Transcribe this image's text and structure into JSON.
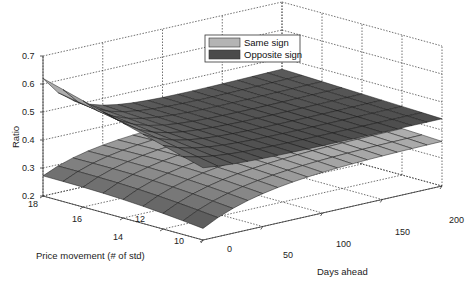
{
  "chart_data": {
    "type": "surface3d",
    "title": "",
    "xlabel": "Days ahead",
    "ylabel": "Price movement (# of std)",
    "zlabel": "Ratio",
    "xlim": [
      0,
      200
    ],
    "ylim": [
      10,
      18
    ],
    "zlim": [
      0.2,
      0.7
    ],
    "x_ticks": [
      0,
      50,
      100,
      150,
      200
    ],
    "y_ticks": [
      10,
      12,
      14,
      16,
      18
    ],
    "z_ticks": [
      0.2,
      0.3,
      0.4,
      0.5,
      0.6,
      0.7
    ],
    "grid": true,
    "legend_position": "upper center",
    "x": [
      0,
      12.5,
      25,
      37.5,
      50,
      62.5,
      75,
      87.5,
      100,
      112.5,
      125,
      137.5,
      150,
      162.5,
      175,
      187.5,
      200
    ],
    "y": [
      10,
      11,
      12,
      13,
      14,
      15,
      16,
      17,
      18
    ],
    "series": [
      {
        "name": "Same sign",
        "color": "#b4b4b4",
        "note": "Upper surface; ~0.62 at (day 0, 18 std), flattening to ~0.44 near day 200",
        "z_corner_values": {
          "day0_std18": 0.62,
          "day0_std10": 0.44,
          "day200_std18": 0.46,
          "day200_std10": 0.44
        }
      },
      {
        "name": "Opposite sign",
        "color": "#4a4a4a",
        "note": "Lower surface; ~0.32 at (day 0, 18 std), dipping to ~0.22 near day 0 low std, rising to ~0.36 near day 200",
        "z_corner_values": {
          "day0_std18": 0.32,
          "day0_std10": 0.24,
          "day200_std18": 0.36,
          "day200_std10": 0.36
        }
      }
    ]
  },
  "legend": {
    "items": [
      {
        "label": "Same sign",
        "color": "#b4b4b4"
      },
      {
        "label": "Opposite sign",
        "color": "#4a4a4a"
      }
    ]
  },
  "axes": {
    "z_label": "Ratio",
    "y_label": "Price movement (# of std)",
    "x_label": "Days ahead",
    "z_tick_labels": [
      "0.2",
      "0.3",
      "0.4",
      "0.5",
      "0.6",
      "0.7"
    ],
    "y_tick_labels": [
      "10",
      "12",
      "14",
      "16",
      "18"
    ],
    "x_tick_labels": [
      "0",
      "50",
      "100",
      "150",
      "200"
    ]
  }
}
